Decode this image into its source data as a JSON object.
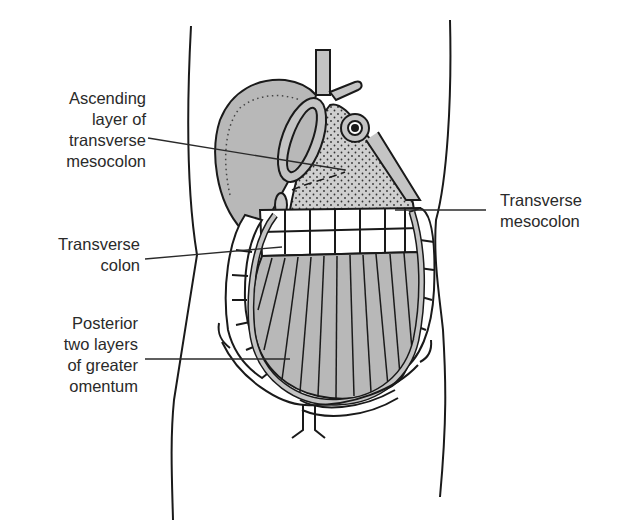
{
  "diagram": {
    "colors": {
      "outline": "#1a1a1a",
      "fill_gray": "#b8b8b8",
      "fill_light": "#d4d4d4",
      "background": "#ffffff"
    },
    "labels": [
      {
        "id": "ascending-layer",
        "lines": [
          "Ascending",
          "layer of",
          "transverse",
          "mesocolon"
        ],
        "side": "left"
      },
      {
        "id": "transverse-mesocolon",
        "lines": [
          "Transverse",
          "mesocolon"
        ],
        "side": "right"
      },
      {
        "id": "transverse-colon",
        "lines": [
          "Transverse",
          "colon"
        ],
        "side": "left"
      },
      {
        "id": "posterior-omentum",
        "lines": [
          "Posterior",
          "two layers",
          "of greater",
          "omentum"
        ],
        "side": "left"
      }
    ]
  }
}
